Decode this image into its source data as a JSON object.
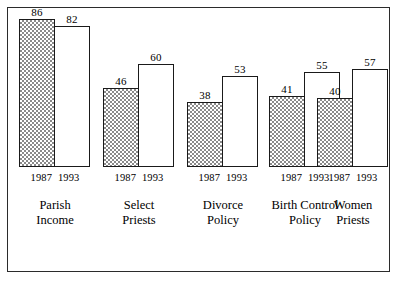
{
  "figure": {
    "background_color": "#ffffff",
    "frame_color": "#2b2b2b",
    "shaded_color": "#8a8a8a",
    "open_color": "#ffffff",
    "outline_color": "#1a1a1a"
  },
  "chart_data": {
    "type": "bar",
    "title": "",
    "subtitle": "",
    "xlabel": "",
    "ylabel": "",
    "ylim": [
      0,
      100
    ],
    "grid": false,
    "legend_position": "none",
    "categories": [
      "Parish Income",
      "Select Priests",
      "Divorce Policy",
      "Birth Control Policy",
      "Women Priests"
    ],
    "category_lines": [
      [
        "Parish",
        "Income"
      ],
      [
        "Select",
        "Priests"
      ],
      [
        "Divorce",
        "Policy"
      ],
      [
        "Birth Control",
        "Policy"
      ],
      [
        "Women",
        "Priests"
      ]
    ],
    "series": [
      {
        "name": "1987",
        "style": "shaded",
        "values": [
          86,
          46,
          38,
          41,
          40
        ]
      },
      {
        "name": "1993",
        "style": "open",
        "values": [
          82,
          60,
          53,
          55,
          57
        ]
      }
    ],
    "tick_labels": [
      "1987",
      "1993"
    ],
    "annotations": []
  },
  "groups": [
    {
      "category": "Parish Income",
      "line1": "Parish",
      "line2": "Income",
      "ticks": {
        "left": "1987",
        "right": "1993"
      },
      "bars": [
        {
          "series": "1987",
          "value": 86,
          "label": "86",
          "style": "shaded"
        },
        {
          "series": "1993",
          "value": 82,
          "label": "82",
          "style": "open"
        }
      ]
    },
    {
      "category": "Select Priests",
      "line1": "Select",
      "line2": "Priests",
      "ticks": {
        "left": "1987",
        "right": "1993"
      },
      "bars": [
        {
          "series": "1987",
          "value": 46,
          "label": "46",
          "style": "shaded"
        },
        {
          "series": "1993",
          "value": 60,
          "label": "60",
          "style": "open"
        }
      ]
    },
    {
      "category": "Divorce Policy",
      "line1": "Divorce",
      "line2": "Policy",
      "ticks": {
        "left": "1987",
        "right": "1993"
      },
      "bars": [
        {
          "series": "1987",
          "value": 38,
          "label": "38",
          "style": "shaded"
        },
        {
          "series": "1993",
          "value": 53,
          "label": "53",
          "style": "open"
        }
      ]
    },
    {
      "category": "Birth Control Policy",
      "line1": "Birth Control",
      "line2": "Policy",
      "ticks": {
        "left": "1987",
        "right": "1993"
      },
      "bars": [
        {
          "series": "1987",
          "value": 41,
          "label": "41",
          "style": "shaded"
        },
        {
          "series": "1993",
          "value": 55,
          "label": "55",
          "style": "open"
        }
      ]
    },
    {
      "category": "Women Priests",
      "line1": "Women",
      "line2": "Priests",
      "ticks": {
        "left": "1987",
        "right": "1993"
      },
      "bars": [
        {
          "series": "1987",
          "value": 40,
          "label": "40",
          "style": "shaded"
        },
        {
          "series": "1993",
          "value": 57,
          "label": "57",
          "style": "open"
        }
      ]
    }
  ]
}
